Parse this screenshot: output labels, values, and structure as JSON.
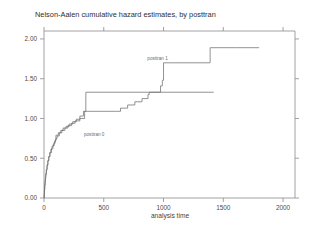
{
  "chart_data": {
    "type": "line",
    "title": "Nelson-Aalen cumulative hazard estimates, by posttran",
    "xlabel": "analysis time",
    "ylabel": "",
    "xlim": [
      0,
      2100
    ],
    "ylim": [
      0,
      2.1
    ],
    "grid": false,
    "legend_position": "inline-annotations",
    "xticks": [
      0,
      500,
      1000,
      1500,
      2000
    ],
    "xtick_labels": [
      "0",
      "500",
      "1000",
      "1500",
      "2000"
    ],
    "yticks": [
      0.0,
      0.5,
      1.0,
      1.5,
      2.0
    ],
    "ytick_labels": [
      "0.00",
      "0.50",
      "1.00",
      "1.50",
      "2.00"
    ],
    "annotations": [
      {
        "text": "posttran 1",
        "x": 950,
        "y": 1.74
      },
      {
        "text": "posttran 0",
        "x": 420,
        "y": 0.78
      }
    ],
    "series": [
      {
        "name": "posttran 0",
        "label": "posttran 0",
        "color": "#6f6f6f",
        "step": "post",
        "points": [
          [
            1,
            0.0
          ],
          [
            2,
            0.05
          ],
          [
            3,
            0.1
          ],
          [
            5,
            0.15
          ],
          [
            8,
            0.2
          ],
          [
            11,
            0.26
          ],
          [
            15,
            0.31
          ],
          [
            20,
            0.36
          ],
          [
            26,
            0.42
          ],
          [
            33,
            0.47
          ],
          [
            40,
            0.52
          ],
          [
            48,
            0.57
          ],
          [
            57,
            0.61
          ],
          [
            67,
            0.65
          ],
          [
            78,
            0.68
          ],
          [
            90,
            0.72
          ],
          [
            100,
            0.75
          ],
          [
            110,
            0.78
          ],
          [
            128,
            0.82
          ],
          [
            150,
            0.85
          ],
          [
            175,
            0.88
          ],
          [
            200,
            0.91
          ],
          [
            230,
            0.94
          ],
          [
            260,
            0.97
          ],
          [
            300,
            1.0
          ],
          [
            340,
            1.09
          ],
          [
            350,
            1.33
          ],
          [
            1400,
            1.33
          ],
          [
            1420,
            1.33
          ]
        ]
      },
      {
        "name": "posttran 1",
        "label": "posttran 1",
        "color": "#6f6f6f",
        "step": "post",
        "points": [
          [
            1,
            0.0
          ],
          [
            2,
            0.05
          ],
          [
            4,
            0.11
          ],
          [
            7,
            0.17
          ],
          [
            10,
            0.23
          ],
          [
            14,
            0.29
          ],
          [
            19,
            0.35
          ],
          [
            25,
            0.41
          ],
          [
            32,
            0.47
          ],
          [
            40,
            0.52
          ],
          [
            50,
            0.57
          ],
          [
            62,
            0.62
          ],
          [
            75,
            0.66
          ],
          [
            85,
            0.7
          ],
          [
            95,
            0.73
          ],
          [
            100,
            0.79
          ],
          [
            120,
            0.82
          ],
          [
            140,
            0.85
          ],
          [
            160,
            0.88
          ],
          [
            185,
            0.9
          ],
          [
            210,
            0.93
          ],
          [
            240,
            0.96
          ],
          [
            270,
            0.99
          ],
          [
            300,
            1.03
          ],
          [
            330,
            1.09
          ],
          [
            345,
            1.09
          ],
          [
            600,
            1.09
          ],
          [
            640,
            1.13
          ],
          [
            700,
            1.17
          ],
          [
            760,
            1.21
          ],
          [
            820,
            1.25
          ],
          [
            870,
            1.3
          ],
          [
            880,
            1.33
          ],
          [
            960,
            1.33
          ],
          [
            975,
            1.41
          ],
          [
            990,
            1.48
          ],
          [
            1000,
            1.7
          ],
          [
            1380,
            1.7
          ],
          [
            1390,
            1.89
          ],
          [
            1600,
            1.89
          ],
          [
            1800,
            1.89
          ]
        ]
      }
    ]
  }
}
